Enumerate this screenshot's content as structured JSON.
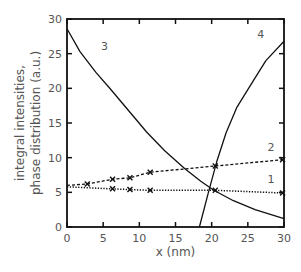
{
  "chart_data": {
    "type": "line",
    "title": "",
    "xlabel": "x (nm)",
    "ylabel_lines": [
      "integral intensities,",
      "phase distribution (a.u.)"
    ],
    "ylabel": "integral intensities, phase distribution (a.u.)",
    "xlim": [
      0,
      30
    ],
    "ylim": [
      0,
      30
    ],
    "xticks": [
      0,
      5,
      10,
      15,
      20,
      25,
      30
    ],
    "yticks": [
      0,
      5,
      10,
      15,
      20,
      25,
      30
    ],
    "grid": false,
    "legend": "none (curves labeled inline 1-4)",
    "series": [
      {
        "name": "1",
        "style": "dotted",
        "marker": "x",
        "points": [
          [
            0,
            5.8
          ],
          [
            6.3,
            5.5
          ],
          [
            8.7,
            5.4
          ],
          [
            11.5,
            5.3
          ],
          [
            20.5,
            5.3
          ],
          [
            29.8,
            4.9
          ]
        ],
        "markers": [
          [
            6.3,
            5.5
          ],
          [
            8.7,
            5.4
          ],
          [
            11.5,
            5.3
          ],
          [
            20.5,
            5.3
          ],
          [
            29.8,
            4.9
          ]
        ],
        "label_pos": [
          28.2,
          6.3
        ]
      },
      {
        "name": "2",
        "style": "dashed",
        "marker": "x",
        "points": [
          [
            0,
            6.0
          ],
          [
            2.8,
            6.2
          ],
          [
            6.3,
            6.9
          ],
          [
            8.7,
            7.1
          ],
          [
            11.5,
            7.9
          ],
          [
            20.5,
            8.8
          ],
          [
            29.8,
            9.7
          ]
        ],
        "markers": [
          [
            2.8,
            6.2
          ],
          [
            6.3,
            6.9
          ],
          [
            8.7,
            7.1
          ],
          [
            11.5,
            7.9
          ],
          [
            20.5,
            8.8
          ],
          [
            29.8,
            9.7
          ]
        ],
        "label_pos": [
          28.2,
          11.0
        ]
      },
      {
        "name": "3",
        "style": "solid",
        "marker": "none",
        "points": [
          [
            0,
            28.6
          ],
          [
            1.8,
            25.3
          ],
          [
            4,
            22.3
          ],
          [
            6,
            19.9
          ],
          [
            8.5,
            16.8
          ],
          [
            11,
            13.7
          ],
          [
            13.5,
            11.0
          ],
          [
            16.3,
            8.4
          ],
          [
            18.5,
            6.6
          ],
          [
            20.3,
            5.3
          ],
          [
            23,
            3.8
          ],
          [
            26,
            2.5
          ],
          [
            30,
            1.2
          ]
        ],
        "label_pos": [
          5.2,
          25.6
        ]
      },
      {
        "name": "4",
        "style": "solid",
        "marker": "none",
        "points": [
          [
            18.3,
            0
          ],
          [
            19.5,
            4.8
          ],
          [
            20.7,
            9.4
          ],
          [
            22,
            13.6
          ],
          [
            23.5,
            17.3
          ],
          [
            25.7,
            21.0
          ],
          [
            27.5,
            24.0
          ],
          [
            30,
            26.8
          ]
        ],
        "label_pos": [
          26.8,
          27.3
        ]
      }
    ]
  }
}
